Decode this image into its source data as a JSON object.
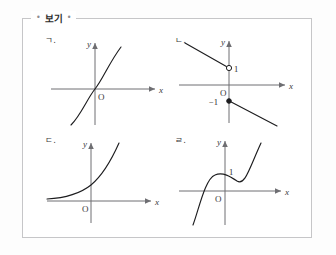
{
  "top_fragment": "​",
  "box": {
    "label": "보기",
    "tick_left": "•",
    "tick_right": "•"
  },
  "items": [
    {
      "key": "a",
      "label": "ㄱ.",
      "x_axis_label": "x",
      "y_axis_label": "y",
      "origin_label": "O",
      "value_labels": []
    },
    {
      "key": "b",
      "label": "ㄴ.",
      "x_axis_label": "x",
      "y_axis_label": "y",
      "origin_label": "O",
      "value_labels": [
        "1",
        "−1"
      ]
    },
    {
      "key": "c",
      "label": "ㄷ.",
      "x_axis_label": "x",
      "y_axis_label": "y",
      "origin_label": "O",
      "value_labels": []
    },
    {
      "key": "d",
      "label": "ㄹ.",
      "x_axis_label": "x",
      "y_axis_label": "y",
      "origin_label": "O",
      "value_labels": [
        "1"
      ]
    }
  ],
  "colors": {
    "border": "#c6c6c8",
    "axis": "#6e6e72",
    "curve": "#1d1d1f",
    "text": "#2b2b2b",
    "background": "#ffffff"
  }
}
